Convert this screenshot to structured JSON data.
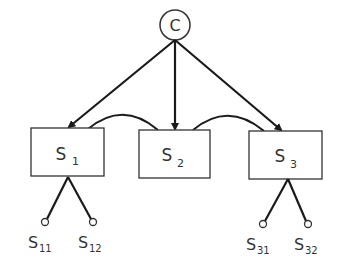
{
  "diagram": {
    "root": {
      "label": "C"
    },
    "nodes": [
      {
        "label": "S",
        "sub": "1"
      },
      {
        "label": "S",
        "sub": "2"
      },
      {
        "label": "S",
        "sub": "3"
      }
    ],
    "leaves": [
      {
        "label": "S",
        "sub": "11"
      },
      {
        "label": "S",
        "sub": "12"
      },
      {
        "label": "S",
        "sub": "31"
      },
      {
        "label": "S",
        "sub": "32"
      }
    ],
    "colors": {
      "stroke": "#1a1a1a",
      "text": "#333333",
      "background": "#ffffff"
    }
  }
}
